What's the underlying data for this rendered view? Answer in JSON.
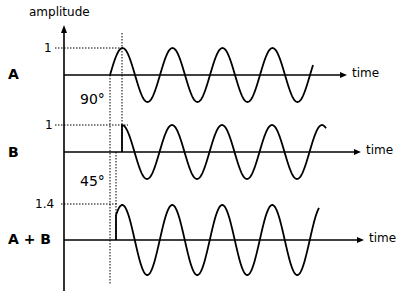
{
  "diagram": {
    "y_axis_label": "amplitude",
    "x_axis_label": "time",
    "signals": [
      {
        "name": "A",
        "label": "A",
        "amplitude_label": "1",
        "phase_start_x": 110,
        "baseline_y": 75,
        "amplitude_px": 27,
        "end_x": 313
      },
      {
        "name": "B",
        "label": "B",
        "amplitude_label": "1",
        "phase_start_x": 122,
        "baseline_y": 152,
        "amplitude_px": 27,
        "end_x": 326
      },
      {
        "name": "A+B",
        "label": "A + B",
        "amplitude_label": "1.4",
        "phase_start_x": 116,
        "baseline_y": 240,
        "amplitude_px": 35,
        "end_x": 319
      }
    ],
    "phase_annotations": [
      {
        "label": "90°",
        "between": [
          "A",
          "B"
        ]
      },
      {
        "label": "45°",
        "between": [
          "B",
          "A+B"
        ]
      }
    ],
    "period_px": 50
  }
}
